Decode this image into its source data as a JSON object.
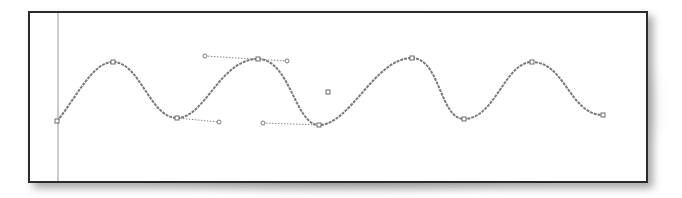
{
  "canvas": {
    "frame": {
      "x": 28,
      "y": 11,
      "width": 620,
      "height": 172,
      "stroke": "#2b2b2b"
    },
    "guide_line": {
      "x": 58,
      "y1": 13,
      "y2": 181,
      "stroke": "#9a9a9a"
    },
    "path_stroke": "#7a7a7a",
    "anchor_points": [
      {
        "x": 57,
        "y": 121
      },
      {
        "x": 113,
        "y": 62
      },
      {
        "x": 177,
        "y": 118
      },
      {
        "x": 258,
        "y": 59
      },
      {
        "x": 319,
        "y": 125
      },
      {
        "x": 412,
        "y": 58
      },
      {
        "x": 464,
        "y": 119
      },
      {
        "x": 532,
        "y": 62
      },
      {
        "x": 603,
        "y": 115
      }
    ],
    "handles": [
      {
        "from": {
          "x": 177,
          "y": 118
        },
        "to": {
          "x": 219,
          "y": 122
        }
      },
      {
        "from": {
          "x": 205,
          "y": 56
        },
        "to": {
          "x": 287,
          "y": 61
        }
      },
      {
        "from": {
          "x": 263,
          "y": 123
        },
        "to": {
          "x": 319,
          "y": 125
        }
      }
    ],
    "center_marker": {
      "x": 328,
      "y": 92
    }
  }
}
